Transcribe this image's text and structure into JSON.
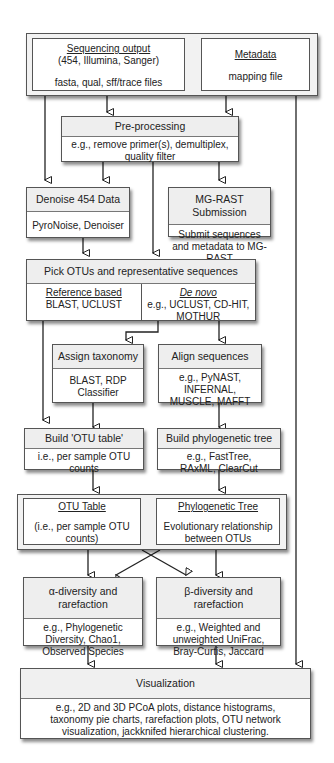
{
  "diagram": {
    "inputs": {
      "sequencing_output": {
        "title": "Sequencing output",
        "subtitle": "(454, Illumina, Sanger)",
        "files": "fasta, qual, sff/trace files"
      },
      "metadata": {
        "title": "Metadata",
        "files": "mapping file"
      }
    },
    "preprocessing": {
      "title": "Pre-processing",
      "body": "e.g., remove primer(s), demultiplex, quality filter"
    },
    "denoise": {
      "title": "Denoise 454 Data",
      "body": "PyroNoise, Denoiser"
    },
    "mgrast": {
      "title": "MG-RAST Submission",
      "body": "Submit sequences and metadata to MG-RAST"
    },
    "pick_otus": {
      "title": "Pick OTUs and representative sequences",
      "reference": {
        "title": "Reference based",
        "body": "BLAST, UCLUST"
      },
      "denovo": {
        "title": "De novo",
        "body": "e.g., UCLUST, CD-HIT, MOTHUR"
      }
    },
    "assign_taxonomy": {
      "title": "Assign taxonomy",
      "body": "BLAST, RDP Classifier"
    },
    "align_sequences": {
      "title": "Align sequences",
      "body": "e.g., PyNAST, INFERNAL, MUSCLE, MAFFT"
    },
    "build_otu_table": {
      "title": "Build 'OTU table'",
      "body": "i.e., per sample OTU counts"
    },
    "build_tree": {
      "title": "Build phylogenetic tree",
      "body": "e.g., FastTree, RAxML, ClearCut"
    },
    "outputs": {
      "otu_table": {
        "title": "OTU Table",
        "body": "(i.e., per sample OTU counts)"
      },
      "phylo_tree": {
        "title": "Phylogenetic Tree",
        "body": "Evolutionary relationship between OTUs"
      }
    },
    "alpha": {
      "title": "α-diversity and rarefaction",
      "body": "e.g., Phylogenetic Diversity, Chao1, Observed Species"
    },
    "beta": {
      "title": "β-diversity and rarefaction",
      "body": "e.g., Weighted and unweighted UniFrac, Bray-Curtis, Jaccard"
    },
    "visualization": {
      "title": "Visualization",
      "body": "e.g., 2D and 3D PCoA plots, distance histograms, taxonomy pie charts, rarefaction plots, OTU network visualization, jackknifed hierarchical clustering."
    }
  }
}
